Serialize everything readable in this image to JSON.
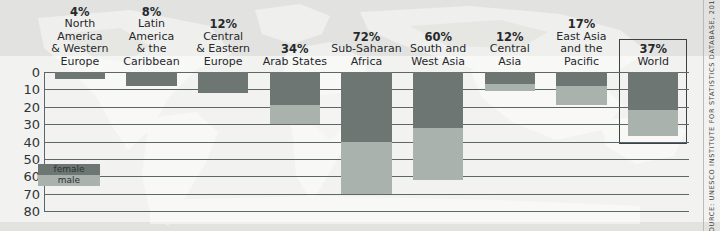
{
  "source_note": "SOURCE: UNESCO INSTITUTE FOR STATISTICS DATABASE, 2011",
  "legend": {
    "female_label": "female",
    "male_label": "male",
    "female_color": "#6d7673",
    "male_color": "#a9b2ac"
  },
  "axis": {
    "ticks": [
      "0",
      "10",
      "20",
      "30",
      "40",
      "50",
      "60",
      "70",
      "80"
    ]
  },
  "groups": [
    {
      "pct": "4%",
      "name_lines": [
        "North",
        "America",
        "& Western",
        "Europe"
      ]
    },
    {
      "pct": "8%",
      "name_lines": [
        "Latin",
        "America",
        "& the",
        "Caribbean"
      ]
    },
    {
      "pct": "12%",
      "name_lines": [
        "Central",
        "& Eastern",
        "Europe"
      ]
    },
    {
      "pct": "34%",
      "name_lines": [
        "Arab States"
      ]
    },
    {
      "pct": "72%",
      "name_lines": [
        "Sub-Saharan",
        "Africa"
      ]
    },
    {
      "pct": "60%",
      "name_lines": [
        "South and",
        "West Asia"
      ]
    },
    {
      "pct": "12%",
      "name_lines": [
        "Central",
        "Asia"
      ]
    },
    {
      "pct": "17%",
      "name_lines": [
        "East Asia",
        "and the",
        "Pacific"
      ]
    },
    {
      "pct": "37%",
      "name_lines": [
        "World"
      ]
    }
  ],
  "chart_data": {
    "type": "bar",
    "title": "",
    "xlabel": "",
    "ylabel": "",
    "ylim": [
      0,
      80
    ],
    "y_inverted": true,
    "grid": true,
    "legend_position": "inside-bottom-left",
    "categories": [
      "North America & Western Europe",
      "Latin America & the Caribbean",
      "Central & Eastern Europe",
      "Arab States",
      "Sub-Saharan Africa",
      "South and West Asia",
      "Central Asia",
      "East Asia and the Pacific",
      "World"
    ],
    "category_percent_labels": [
      "4%",
      "8%",
      "12%",
      "34%",
      "72%",
      "60%",
      "12%",
      "17%",
      "37%"
    ],
    "series": [
      {
        "name": "female",
        "color": "#6d7673",
        "values": [
          4,
          8,
          12,
          19,
          40,
          32,
          7,
          8,
          22
        ]
      },
      {
        "name": "male",
        "color": "#a9b2ac",
        "values": [
          3,
          6,
          10,
          30,
          70,
          62,
          11,
          19,
          37
        ]
      }
    ],
    "highlighted_category": "World"
  }
}
